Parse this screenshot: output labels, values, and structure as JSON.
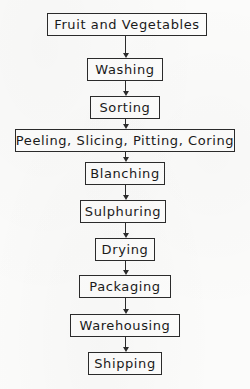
{
  "diagram": {
    "type": "vertical-flowchart",
    "background_color": "#fbfbfa",
    "line_color": "#2b2b2b",
    "text_color": "#1a1a1a",
    "nodes": [
      {
        "id": "fruit-and-vegetables",
        "label": "Fruit and Vegetables",
        "x": 47,
        "y": 13,
        "width": 160,
        "height": 23,
        "font_size": 13
      },
      {
        "id": "washing",
        "label": "Washing",
        "x": 87,
        "y": 58,
        "width": 76,
        "height": 23,
        "font_size": 13
      },
      {
        "id": "sorting",
        "label": "Sorting",
        "x": 90,
        "y": 96,
        "width": 70,
        "height": 23,
        "font_size": 13
      },
      {
        "id": "peeling-slicing-pitting-coring",
        "label": "Peeling, Slicing, Pitting, Coring",
        "x": 15,
        "y": 129,
        "width": 220,
        "height": 23,
        "font_size": 13
      },
      {
        "id": "blanching",
        "label": "Blanching",
        "x": 85,
        "y": 162,
        "width": 80,
        "height": 23,
        "font_size": 13
      },
      {
        "id": "sulphuring",
        "label": "Sulphuring",
        "x": 80,
        "y": 200,
        "width": 86,
        "height": 23,
        "font_size": 13
      },
      {
        "id": "drying",
        "label": "Drying",
        "x": 95,
        "y": 238,
        "width": 60,
        "height": 23,
        "font_size": 13
      },
      {
        "id": "packaging",
        "label": "Packaging",
        "x": 79,
        "y": 275,
        "width": 92,
        "height": 23,
        "font_size": 13
      },
      {
        "id": "warehousing",
        "label": "Warehousing",
        "x": 70,
        "y": 314,
        "width": 110,
        "height": 23,
        "font_size": 13
      },
      {
        "id": "shipping",
        "label": "Shipping",
        "x": 88,
        "y": 352,
        "width": 74,
        "height": 23,
        "font_size": 13
      }
    ],
    "connectors": [
      {
        "id": "arrow-fruit-to-washing",
        "from": "fruit-and-vegetables",
        "to": "washing",
        "x": 125,
        "y": 36,
        "length": 22
      },
      {
        "id": "arrow-washing-to-sorting",
        "from": "washing",
        "to": "sorting",
        "x": 125,
        "y": 81,
        "length": 15
      },
      {
        "id": "arrow-sorting-to-peeling",
        "from": "sorting",
        "to": "peeling-slicing-pitting-coring",
        "x": 125,
        "y": 119,
        "length": 10
      },
      {
        "id": "arrow-peeling-to-blanching",
        "from": "peeling-slicing-pitting-coring",
        "to": "blanching",
        "x": 125,
        "y": 152,
        "length": 10
      },
      {
        "id": "arrow-blanching-to-sulphuring",
        "from": "blanching",
        "to": "sulphuring",
        "x": 125,
        "y": 185,
        "length": 15
      },
      {
        "id": "arrow-sulphuring-to-drying",
        "from": "sulphuring",
        "to": "drying",
        "x": 125,
        "y": 223,
        "length": 15
      },
      {
        "id": "arrow-drying-to-packaging",
        "from": "drying",
        "to": "packaging",
        "x": 125,
        "y": 261,
        "length": 14
      },
      {
        "id": "arrow-packaging-to-warehousing",
        "from": "packaging",
        "to": "warehousing",
        "x": 125,
        "y": 298,
        "length": 16
      },
      {
        "id": "arrow-warehousing-to-shipping",
        "from": "warehousing",
        "to": "shipping",
        "x": 125,
        "y": 337,
        "length": 15
      }
    ]
  }
}
